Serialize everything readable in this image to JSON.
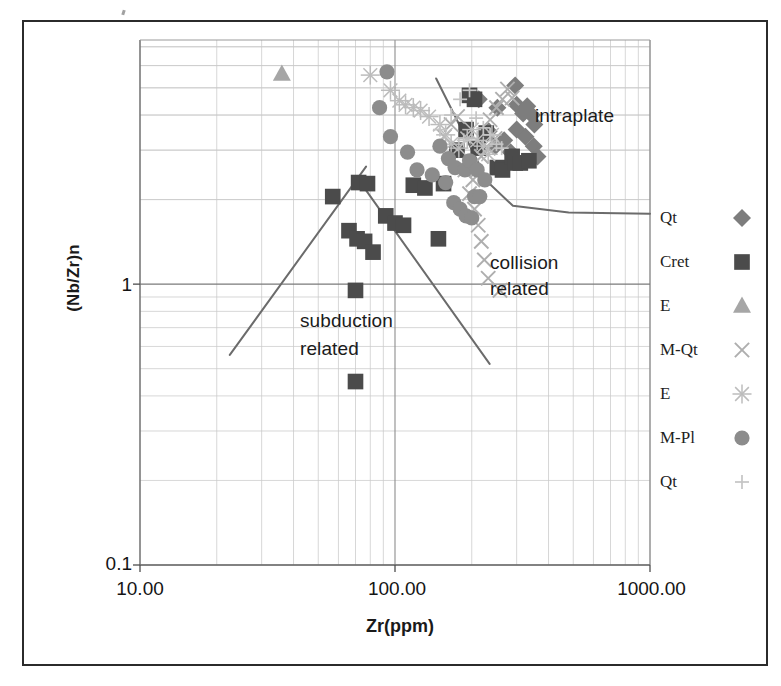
{
  "axes": {
    "xlabel": "Zr(ppm)",
    "ylabel": "(Nb/Zr)n",
    "xticks": [
      "10.00",
      "100.00",
      "1000.00"
    ],
    "yticks": [
      "1",
      "0.1"
    ]
  },
  "annotations": {
    "intraplate": "intraplate",
    "collision": "collision",
    "collision2": "related",
    "subduction": "subduction",
    "subduction2": "related"
  },
  "legend": {
    "items": [
      {
        "label": "Qt",
        "marker": "diamond-icon",
        "color": "#7d7d7d"
      },
      {
        "label": "Cret",
        "marker": "square-icon",
        "color": "#4b4b4b"
      },
      {
        "label": "E",
        "marker": "triangle-icon",
        "color": "#a6a6a6"
      },
      {
        "label": "M-Qt",
        "marker": "x-icon",
        "color": "#aeaeae"
      },
      {
        "label": "E",
        "marker": "asterisk-icon",
        "color": "#bcbcbc"
      },
      {
        "label": "M-Pl",
        "marker": "circle-icon",
        "color": "#8c8c8c"
      },
      {
        "label": "Qt",
        "marker": "plus-icon",
        "color": "#c4c4c4"
      }
    ]
  },
  "chart_data": {
    "type": "scatter",
    "title": "",
    "xlabel": "Zr(ppm)",
    "ylabel": "(Nb/Zr)n",
    "xscale": "log",
    "yscale": "log",
    "xlim": [
      10,
      1000
    ],
    "ylim": [
      0.1,
      7.4
    ],
    "grid": true,
    "legend_position": "right",
    "colors": {
      "Qt-diamond": "#7d7d7d",
      "Cret-square": "#4b4b4b",
      "E-triangle": "#a6a6a6",
      "M-Qt-x": "#aeaeae",
      "E-asterisk": "#bcbcbc",
      "M-Pl-circle": "#8c8c8c",
      "Qt-plus": "#c4c4c4"
    },
    "series": [
      {
        "name": "Qt",
        "marker": "diamond",
        "color": "#7d7d7d",
        "points": [
          [
            213,
            4.55
          ],
          [
            252,
            4.25
          ],
          [
            296,
            5.1
          ],
          [
            300,
            4.35
          ],
          [
            318,
            4.05
          ],
          [
            330,
            4.3
          ],
          [
            344,
            4.0
          ],
          [
            352,
            3.7
          ],
          [
            300,
            3.55
          ],
          [
            325,
            3.35
          ],
          [
            268,
            3.25
          ],
          [
            284,
            2.95
          ],
          [
            247,
            3.1
          ],
          [
            233,
            3.5
          ],
          [
            350,
            3.1
          ],
          [
            362,
            2.85
          ]
        ]
      },
      {
        "name": "Cret",
        "marker": "square",
        "color": "#4b4b4b",
        "points": [
          [
            57,
            2.05
          ],
          [
            72,
            2.3
          ],
          [
            78,
            2.28
          ],
          [
            66,
            1.55
          ],
          [
            71,
            1.45
          ],
          [
            76,
            1.42
          ],
          [
            82,
            1.3
          ],
          [
            70,
            0.95
          ],
          [
            70,
            0.45
          ],
          [
            92,
            1.75
          ],
          [
            100,
            1.65
          ],
          [
            108,
            1.62
          ],
          [
            118,
            2.25
          ],
          [
            131,
            2.2
          ],
          [
            148,
            1.45
          ],
          [
            155,
            2.28
          ],
          [
            175,
            3.0
          ],
          [
            190,
            3.55
          ],
          [
            196,
            4.7
          ],
          [
            205,
            4.55
          ],
          [
            212,
            3.05
          ],
          [
            228,
            3.45
          ],
          [
            252,
            2.6
          ],
          [
            264,
            2.55
          ],
          [
            288,
            2.85
          ],
          [
            296,
            2.7
          ],
          [
            310,
            2.7
          ],
          [
            335,
            2.75
          ]
        ]
      },
      {
        "name": "E",
        "marker": "triangle",
        "color": "#a6a6a6",
        "points": [
          [
            36,
            5.6
          ]
        ]
      },
      {
        "name": "M-Qt",
        "marker": "x",
        "color": "#aeaeae",
        "points": [
          [
            205,
            1.85
          ],
          [
            212,
            1.62
          ],
          [
            218,
            1.42
          ],
          [
            224,
            1.22
          ],
          [
            232,
            1.05
          ],
          [
            258,
            0.95
          ],
          [
            196,
            2.1
          ],
          [
            202,
            2.35
          ],
          [
            188,
            2.55
          ],
          [
            218,
            2.85
          ],
          [
            232,
            3.05
          ],
          [
            247,
            3.3
          ],
          [
            250,
            4.25
          ],
          [
            264,
            4.55
          ],
          [
            276,
            4.95
          ],
          [
            288,
            4.6
          ],
          [
            176,
            3.95
          ],
          [
            166,
            3.7
          ],
          [
            156,
            3.35
          ],
          [
            236,
            3.85
          ]
        ]
      },
      {
        "name": "E",
        "marker": "asterisk",
        "color": "#bcbcbc",
        "points": [
          [
            80,
            5.55
          ],
          [
            96,
            4.9
          ],
          [
            104,
            4.5
          ],
          [
            110,
            4.35
          ],
          [
            118,
            4.25
          ],
          [
            126,
            4.15
          ],
          [
            136,
            3.95
          ],
          [
            150,
            3.7
          ],
          [
            158,
            3.4
          ],
          [
            166,
            3.15
          ],
          [
            178,
            3.05
          ],
          [
            192,
            3.3
          ],
          [
            200,
            3.55
          ],
          [
            210,
            3.25
          ],
          [
            222,
            3.1
          ],
          [
            232,
            2.9
          ],
          [
            240,
            3.4
          ]
        ]
      },
      {
        "name": "M-Pl",
        "marker": "circle",
        "color": "#8c8c8c",
        "points": [
          [
            93,
            5.7
          ],
          [
            87,
            4.25
          ],
          [
            96,
            3.35
          ],
          [
            112,
            2.95
          ],
          [
            122,
            2.55
          ],
          [
            140,
            2.45
          ],
          [
            158,
            2.3
          ],
          [
            170,
            1.95
          ],
          [
            180,
            1.85
          ],
          [
            190,
            1.75
          ],
          [
            200,
            1.72
          ],
          [
            205,
            2.05
          ],
          [
            215,
            2.05
          ],
          [
            172,
            2.6
          ],
          [
            188,
            2.55
          ],
          [
            196,
            2.75
          ],
          [
            210,
            2.55
          ],
          [
            225,
            2.35
          ],
          [
            150,
            3.1
          ],
          [
            162,
            2.8
          ]
        ]
      },
      {
        "name": "Qt",
        "marker": "plus",
        "color": "#c4c4c4",
        "points": [
          [
            166,
            4.0
          ],
          [
            180,
            4.55
          ],
          [
            196,
            4.9
          ],
          [
            208,
            3.9
          ],
          [
            222,
            3.6
          ],
          [
            236,
            3.4
          ],
          [
            250,
            3.15
          ],
          [
            262,
            3.05
          ],
          [
            150,
            3.55
          ],
          [
            186,
            3.25
          ]
        ]
      }
    ],
    "boundary_lines": [
      {
        "name": "subduction-left",
        "points": [
          [
            22.5,
            0.56
          ],
          [
            77,
            2.62
          ]
        ]
      },
      {
        "name": "subduction-right",
        "points": [
          [
            72,
            2.35
          ],
          [
            235,
            0.52
          ]
        ]
      },
      {
        "name": "intraplate-boundary",
        "points": [
          [
            145,
            5.4
          ],
          [
            232,
            2.3
          ],
          [
            290,
            1.9
          ],
          [
            480,
            1.8
          ],
          [
            1000,
            1.78
          ]
        ]
      }
    ]
  }
}
